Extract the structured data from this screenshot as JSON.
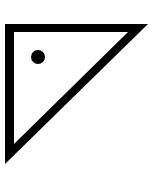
{
  "icon": {
    "name": "right-triangle-with-dot",
    "stroke_color": "#000000",
    "fill_color": "#ffffff",
    "background": "#ffffff"
  }
}
